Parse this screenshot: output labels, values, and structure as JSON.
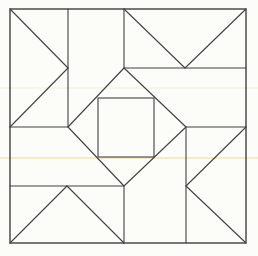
{
  "canvas": {
    "width": 258,
    "height": 256,
    "background_color": "#fcfcf9",
    "line_color": "#414141",
    "border_stroke_width": 1.4,
    "inner_stroke_width": 1.1,
    "artifact_color": "#e8dd8f"
  },
  "figure": {
    "border": {
      "x": 10,
      "y": 9,
      "width": 236,
      "height": 234
    },
    "segments": [
      {
        "name": "vertical-top-left",
        "x1": 68,
        "y1": 9,
        "x2": 68,
        "y2": 127
      },
      {
        "name": "vertical-top-center",
        "x1": 124,
        "y1": 9,
        "x2": 124,
        "y2": 68
      },
      {
        "name": "vertical-bottom-right",
        "x1": 186,
        "y1": 127,
        "x2": 186,
        "y2": 243
      },
      {
        "name": "vertical-bottom-center",
        "x1": 124,
        "y1": 186,
        "x2": 124,
        "y2": 243
      },
      {
        "name": "horizontal-top-right",
        "x1": 124,
        "y1": 68,
        "x2": 246,
        "y2": 68
      },
      {
        "name": "horizontal-middle-left",
        "x1": 10,
        "y1": 127,
        "x2": 68,
        "y2": 127
      },
      {
        "name": "horizontal-middle-right",
        "x1": 186,
        "y1": 127,
        "x2": 246,
        "y2": 127
      },
      {
        "name": "horizontal-bottom-left",
        "x1": 10,
        "y1": 186,
        "x2": 124,
        "y2": 186
      },
      {
        "name": "left-triangle-upper-edge",
        "x1": 10,
        "y1": 9,
        "x2": 68,
        "y2": 68
      },
      {
        "name": "left-triangle-lower-edge",
        "x1": 68,
        "y1": 68,
        "x2": 10,
        "y2": 127
      },
      {
        "name": "top-triangle-left-edge",
        "x1": 124,
        "y1": 9,
        "x2": 185,
        "y2": 68
      },
      {
        "name": "top-triangle-right-edge",
        "x1": 185,
        "y1": 68,
        "x2": 246,
        "y2": 9
      },
      {
        "name": "right-triangle-upper-edge",
        "x1": 246,
        "y1": 127,
        "x2": 186,
        "y2": 186
      },
      {
        "name": "right-triangle-lower-edge",
        "x1": 186,
        "y1": 186,
        "x2": 246,
        "y2": 243
      },
      {
        "name": "bottom-triangle-left-edge",
        "x1": 10,
        "y1": 243,
        "x2": 67,
        "y2": 186
      },
      {
        "name": "bottom-triangle-right-edge",
        "x1": 67,
        "y1": 186,
        "x2": 124,
        "y2": 243
      }
    ],
    "diamond": {
      "points": [
        [
          124,
          68
        ],
        [
          186,
          127
        ],
        [
          124,
          186
        ],
        [
          68,
          127
        ]
      ]
    },
    "inner_square": {
      "x": 98,
      "y": 98,
      "width": 56,
      "height": 59
    },
    "scan_artifacts": [
      {
        "y": 157,
        "height": 2,
        "opacity": 0.5
      },
      {
        "y": 87,
        "height": 2,
        "opacity": 0.18
      }
    ]
  }
}
